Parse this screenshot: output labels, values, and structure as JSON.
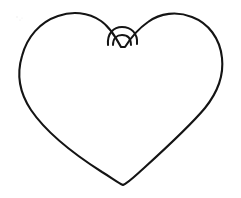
{
  "image": {
    "title": "Heart Outline Drawing",
    "subject": "heart",
    "style": "hand-drawn line art / coloring-book outline",
    "medium": "black ink line on white paper",
    "canvas": {
      "width": 241,
      "height": 198,
      "background_color": "#ffffff"
    },
    "stroke": {
      "color": "#141414",
      "width_px": 2.1,
      "linecap": "round",
      "linejoin": "round",
      "fill": "none"
    },
    "subject_bounds": {
      "left": 19,
      "right": 228,
      "top": 12,
      "bottom": 186
    },
    "parts": [
      {
        "name": "left-lobe",
        "description": "large rounded upper-left bulge of the heart",
        "apex": {
          "x": 70,
          "y": 13
        }
      },
      {
        "name": "right-lobe",
        "description": "large rounded upper-right bulge of the heart",
        "apex": {
          "x": 172,
          "y": 14
        }
      },
      {
        "name": "center-cleft",
        "description": "V-shaped notch between the two lobes with a small semicircular arc bridging it",
        "vertex": {
          "x": 121,
          "y": 47
        }
      },
      {
        "name": "cleft-arc",
        "description": "outer semicircular loop drawn across the top of the cleft notch",
        "span_x": [
          108,
          136
        ],
        "peak_y": 29
      },
      {
        "name": "cleft-inner-arc",
        "description": "smaller inner arc nested beneath the outer cleft loop",
        "span_x": [
          113,
          131
        ],
        "peak_y": 36
      },
      {
        "name": "left-flank",
        "description": "long nearly straight diagonal running from left lobe down to the bottom point"
      },
      {
        "name": "right-flank",
        "description": "long nearly straight diagonal running from right lobe down to the bottom point"
      },
      {
        "name": "bottom-point",
        "description": "soft rounded V where the two flanks meet at the base",
        "tip": {
          "x": 123,
          "y": 185
        }
      }
    ],
    "geometry": {
      "outline_path": "M 121 47 C 116 38 110 27 101 21 C 88 12 72 11 58 16 C 40 22 27 37 22 56 C 16 76 21 95 31 110 C 48 135 80 158 102 172 C 112 178 118 183 123 185 C 128 183 135 176 144 168 C 166 148 190 126 205 108 C 217 93 224 76 222 58 C 220 38 208 23 192 17 C 177 11 160 13 148 22 C 138 29 130 39 125 47 Z",
      "cleft_arc_path": "M 108 45 C 107 33 114 27 122 27 C 131 27 138 33 137 44",
      "cleft_inner_path": "M 113 45 C 113 38 117 35 122 35 C 128 35 131 39 131 45"
    },
    "colors": {
      "ink": "#141414",
      "paper": "#ffffff",
      "speck": "#e9e9e9"
    },
    "text_content": [],
    "specks": [
      {
        "x": 17,
        "y": 17,
        "r": 0.7
      },
      {
        "x": 20,
        "y": 20,
        "r": 0.6
      },
      {
        "x": 22,
        "y": 18,
        "r": 0.5
      }
    ]
  }
}
